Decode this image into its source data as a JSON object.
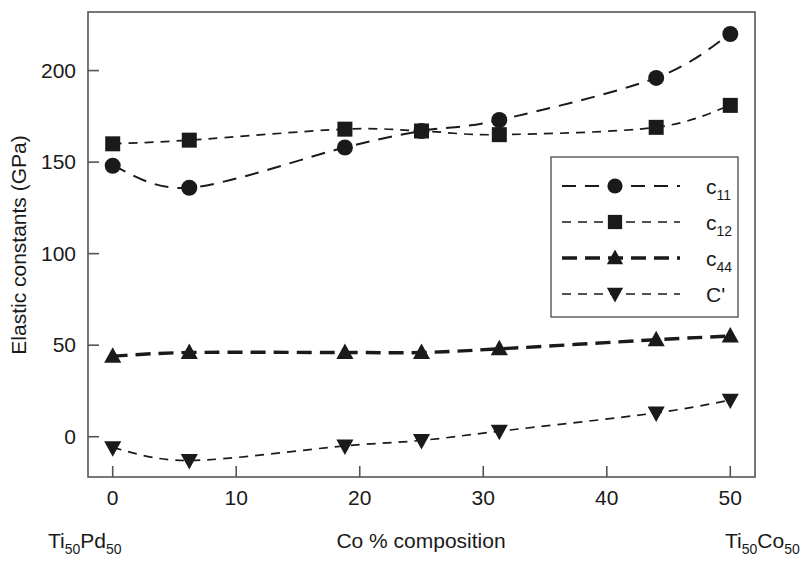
{
  "chart_data": {
    "type": "line",
    "title": "",
    "xlabel": "Co % composition",
    "ylabel": "Elastic constants (GPa)",
    "xlim": [
      -2,
      52
    ],
    "ylim": [
      -22,
      232
    ],
    "xticks": [
      0,
      10,
      20,
      30,
      40,
      50
    ],
    "yticks": [
      0,
      50,
      100,
      150,
      200
    ],
    "xtick_labels": [
      "0",
      "10",
      "20",
      "30",
      "40",
      "50"
    ],
    "ytick_labels": [
      "0",
      "50",
      "100",
      "150",
      "200"
    ],
    "grid": false,
    "legend_position": "center-right",
    "x_left_endpoint_label": "Ti50Pd50",
    "x_right_endpoint_label": "Ti50Co50",
    "series": [
      {
        "name": "c11",
        "label_base": "c",
        "label_sub": "11",
        "marker": "circle",
        "line_style": "dashed",
        "color": "#1a1a1a",
        "x": [
          0,
          6.2,
          18.8,
          25,
          31.3,
          44,
          50
        ],
        "y": [
          148,
          136,
          158,
          167,
          173,
          196,
          220
        ]
      },
      {
        "name": "c12",
        "label_base": "c",
        "label_sub": "12",
        "marker": "square",
        "line_style": "dotted",
        "color": "#1a1a1a",
        "x": [
          0,
          6.2,
          18.8,
          25,
          31.3,
          44,
          50
        ],
        "y": [
          160,
          162,
          168,
          167,
          165,
          169,
          181
        ]
      },
      {
        "name": "c44",
        "label_base": "c",
        "label_sub": "44",
        "marker": "triangle-up",
        "line_style": "dashed-bold",
        "color": "#1a1a1a",
        "x": [
          0,
          6.2,
          18.8,
          25,
          31.3,
          44,
          50
        ],
        "y": [
          44,
          46,
          46,
          46,
          48,
          53,
          55
        ]
      },
      {
        "name": "Cprime",
        "label_base": "C'",
        "label_sub": "",
        "marker": "triangle-down",
        "line_style": "dotted",
        "color": "#1a1a1a",
        "x": [
          0,
          6.2,
          18.8,
          25,
          31.3,
          44,
          50
        ],
        "y": [
          -6,
          -13,
          -5,
          -2,
          3,
          13,
          20
        ]
      }
    ]
  },
  "axes": {
    "y_title": "Elastic constants (GPa)",
    "x_title": "Co % composition"
  },
  "legend": {
    "entries": [
      {
        "label": "c",
        "sub": "11",
        "marker": "circle"
      },
      {
        "label": "c",
        "sub": "12",
        "marker": "square"
      },
      {
        "label": "c",
        "sub": "44",
        "marker": "triangle-up"
      },
      {
        "label": "C'",
        "sub": "",
        "marker": "triangle-down"
      }
    ]
  },
  "endpoints": {
    "left": {
      "base1": "Ti",
      "sub1": "50",
      "base2": "Pd",
      "sub2": "50"
    },
    "right": {
      "base1": "Ti",
      "sub1": "50",
      "base2": "Co",
      "sub2": "50"
    }
  },
  "colors": {
    "ink": "#1a1a1a",
    "frame": "#555555",
    "background": "#ffffff"
  }
}
